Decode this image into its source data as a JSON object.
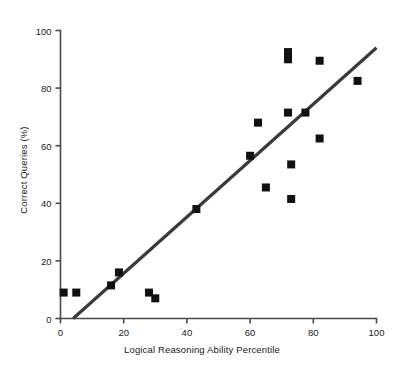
{
  "chart_data": {
    "type": "scatter",
    "title": "",
    "xlabel": "Logical Reasoning Ability Percentile",
    "ylabel": "Correct Queries (%)",
    "xlim": [
      0,
      100
    ],
    "ylim": [
      0,
      100
    ],
    "xticks": [
      0,
      20,
      40,
      60,
      80,
      100
    ],
    "yticks": [
      0,
      20,
      40,
      60,
      80,
      100
    ],
    "xtick_labels": [
      "0",
      "20",
      "40",
      "60",
      "80",
      "100"
    ],
    "ytick_labels": [
      "0",
      "20",
      "40",
      "60",
      "80",
      "100"
    ],
    "grid": false,
    "legend": null,
    "marker": "filled-square",
    "marker_color": "#111111",
    "series": [
      {
        "name": "Observations",
        "points": [
          {
            "x": 1.0,
            "y": 9.0
          },
          {
            "x": 5.0,
            "y": 9.0
          },
          {
            "x": 16.0,
            "y": 11.5
          },
          {
            "x": 18.5,
            "y": 16.0
          },
          {
            "x": 28.0,
            "y": 9.0
          },
          {
            "x": 30.0,
            "y": 7.0
          },
          {
            "x": 43.0,
            "y": 38.0
          },
          {
            "x": 60.0,
            "y": 56.5
          },
          {
            "x": 62.5,
            "y": 68.0
          },
          {
            "x": 65.0,
            "y": 45.5
          },
          {
            "x": 72.0,
            "y": 92.5
          },
          {
            "x": 72.0,
            "y": 90.0
          },
          {
            "x": 72.0,
            "y": 71.5
          },
          {
            "x": 73.0,
            "y": 53.5
          },
          {
            "x": 73.0,
            "y": 41.5
          },
          {
            "x": 77.5,
            "y": 71.5
          },
          {
            "x": 82.0,
            "y": 89.5
          },
          {
            "x": 82.0,
            "y": 62.5
          },
          {
            "x": 94.0,
            "y": 82.5
          }
        ]
      }
    ],
    "trendline": {
      "name": "Linear fit",
      "color": "#3a3a3a",
      "width": 3.2,
      "x0": 4.0,
      "y0": 0.0,
      "x1": 100.0,
      "y1": 94.0
    },
    "axis_color": "#4a4a4a",
    "text_color": "#1a1a1a"
  }
}
